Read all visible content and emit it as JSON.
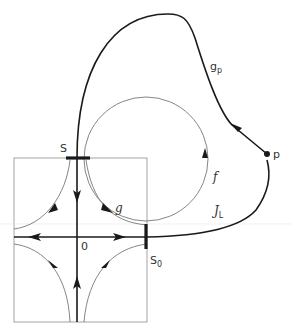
{
  "diagram": {
    "type": "phase-portrait",
    "colors": {
      "thick_stroke": "#1a1a1a",
      "thin_stroke": "#777777",
      "box_stroke": "#9a9a9a",
      "text": "#333333",
      "background": "#ffffff"
    },
    "labels": {
      "S": "S",
      "S0_main": "S",
      "S0_sub": "0",
      "origin": "0",
      "g": "g",
      "gp_main": "g",
      "gp_sub": "p",
      "f": "f",
      "JL_main": "J",
      "JL_sub": "L",
      "p": "p"
    },
    "elements": [
      {
        "name": "local-box",
        "kind": "rectangle"
      },
      {
        "name": "stable-manifold",
        "kind": "vertical axis, arrows pointing toward origin"
      },
      {
        "name": "unstable-manifold",
        "kind": "horizontal axis, arrows pointing away from origin"
      },
      {
        "name": "section-S",
        "kind": "thick horizontal bar on top edge"
      },
      {
        "name": "section-S0",
        "kind": "thick vertical bar on right edge"
      },
      {
        "name": "orbit-f",
        "kind": "circle, counter-clockwise arrow"
      },
      {
        "name": "orbit-g",
        "kind": "hyperbolic trajectory from S to S0"
      },
      {
        "name": "curve-gp",
        "kind": "thick curve from p back to S"
      },
      {
        "name": "curve-JL",
        "kind": "thick curve from S0 to p"
      },
      {
        "name": "point-p",
        "kind": "filled dot"
      }
    ]
  }
}
